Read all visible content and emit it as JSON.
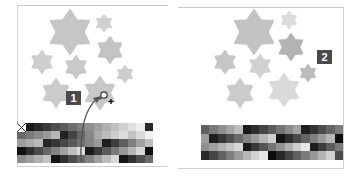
{
  "labels": {
    "step1": "1",
    "step2": "2"
  },
  "colors": {
    "badge_bg": "#4a4a4a",
    "badge_text": "#ffffff",
    "star_default": "#c8c8c8"
  },
  "icons": {
    "none_swatch": "no-color-icon",
    "cursor": "eyedropper-add-cursor-icon",
    "arrow": "curved-arrow-icon"
  },
  "left_panel": {
    "stars": [
      {
        "x": 70,
        "y": 32,
        "r": 22,
        "fill": "#c6c6c6"
      },
      {
        "x": 104,
        "y": 23,
        "r": 8,
        "fill": "#d2d2d2"
      },
      {
        "x": 110,
        "y": 50,
        "r": 13,
        "fill": "#c4c4c4"
      },
      {
        "x": 42,
        "y": 62,
        "r": 11,
        "fill": "#cfcfcf"
      },
      {
        "x": 76,
        "y": 67,
        "r": 11,
        "fill": "#c9c9c9"
      },
      {
        "x": 125,
        "y": 74,
        "r": 8,
        "fill": "#cdcdcd"
      },
      {
        "x": 56,
        "y": 93,
        "r": 14,
        "fill": "#cbcbcb"
      },
      {
        "x": 100,
        "y": 93,
        "r": 16,
        "fill": "#c8c8c8"
      }
    ],
    "swatches": {
      "cols": 16,
      "rows": 5,
      "values": [
        "#ffffff",
        "#1a1a1a",
        "#2b2b2b",
        "#3a3a3a",
        "#4d4d4d",
        "#5c5c5c",
        "#6d6d6d",
        "#7e7e7e",
        "#8f8f8f",
        "#9f9f9f",
        "#b0b0b0",
        "#c0c0c0",
        "#d0d0d0",
        "#e0e0e0",
        "#eeeeee",
        "#2a2a2a",
        "#6a6a6a",
        "#7a7a7a",
        "#8a8a8a",
        "#9a9a9a",
        "#b5b5b5",
        "#222222",
        "#444444",
        "#666666",
        "#888888",
        "#aaaaaa",
        "#bbbbbb",
        "#cccccc",
        "#dddddd",
        "#c2c2c2",
        "#d8d8d8",
        "#efefef",
        "#9d9d9d",
        "#aaaaaa",
        "#b8b8b8",
        "#262626",
        "#363636",
        "#484848",
        "#5b5b5b",
        "#707070",
        "#858585",
        "#999999",
        "#1e1e1e",
        "#3d3d3d",
        "#5f5f5f",
        "#7f7f7f",
        "#a0a0a0",
        "#bfbfbf",
        "#111111",
        "#2e2e2e",
        "#4a4a4a",
        "#676767",
        "#848484",
        "#a1a1a1",
        "#bebebe",
        "#dbdbdb",
        "#1c1c1c",
        "#3b3b3b",
        "#5a5a5a",
        "#797979",
        "#989898",
        "#b7b7b7",
        "#d6d6d6",
        "#0f0f0f",
        "#8c8c8c",
        "#9e9e9e",
        "#b1b1b1",
        "#c3c3c3",
        "#141414",
        "#303030",
        "#4c4c4c",
        "#686868",
        "#848484",
        "#a0a0a0",
        "#bcbcbc",
        "#d8d8d8",
        "#161616",
        "#323232",
        "#4e4e4e",
        "#6a6a6a"
      ]
    }
  },
  "right_panel": {
    "stars": [
      {
        "x": 254,
        "y": 32,
        "r": 22,
        "fill": "#c3c3c3"
      },
      {
        "x": 289,
        "y": 20,
        "r": 8,
        "fill": "#dcdcdc"
      },
      {
        "x": 291,
        "y": 47,
        "r": 13,
        "fill": "#b3b3b3"
      },
      {
        "x": 225,
        "y": 62,
        "r": 11,
        "fill": "#c6c6c6"
      },
      {
        "x": 260,
        "y": 66,
        "r": 11,
        "fill": "#d0d0d0"
      },
      {
        "x": 308,
        "y": 73,
        "r": 8,
        "fill": "#bcbcbc"
      },
      {
        "x": 240,
        "y": 93,
        "r": 14,
        "fill": "#cbcbcb"
      },
      {
        "x": 284,
        "y": 90,
        "r": 16,
        "fill": "#dadada"
      }
    ],
    "swatches": {
      "cols": 17,
      "rows": 4,
      "values": [
        "#5e5e5e",
        "#7a7a7a",
        "#8f8f8f",
        "#a6a6a6",
        "#bdbdbd",
        "#1b1b1b",
        "#2d2d2d",
        "#444444",
        "#5b5b5b",
        "#737373",
        "#8b8b8b",
        "#a2a2a2",
        "#1e1e1e",
        "#333333",
        "#4b4b4b",
        "#646464",
        "#7c7c7c",
        "#9d9d9d",
        "#1f1f1f",
        "#373737",
        "#505050",
        "#6a6a6a",
        "#838383",
        "#9c9c9c",
        "#b5b5b5",
        "#cecece",
        "#141414",
        "#2f2f2f",
        "#4a4a4a",
        "#656565",
        "#808080",
        "#9b9b9b",
        "#b6b6b6",
        "#0e0e0e",
        "#8e8e8e",
        "#a0a0a0",
        "#b2b2b2",
        "#c4c4c4",
        "#d6d6d6",
        "#1a1a1a",
        "#383838",
        "#565656",
        "#747474",
        "#929292",
        "#b0b0b0",
        "#cecece",
        "#e8e8e8",
        "#1d1d1d",
        "#3c3c3c",
        "#5b5b5b",
        "#7a7a7a",
        "#2a2a2a",
        "#464646",
        "#626262",
        "#7e7e7e",
        "#9a9a9a",
        "#b6b6b6",
        "#d2d2d2",
        "#e6e6e6",
        "#0c0c0c",
        "#282828",
        "#444444",
        "#606060",
        "#7c7c7c",
        "#989898",
        "#b4b4b4",
        "#d0d0d0",
        "#4c4c4c"
      ]
    }
  }
}
